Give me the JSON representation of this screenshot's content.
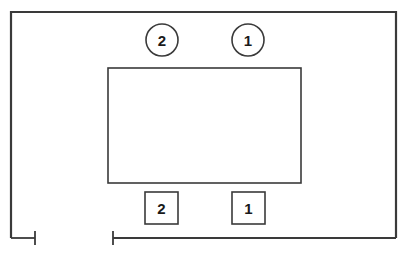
{
  "drawing": {
    "title": "Technical line drawing with numbered callouts",
    "canvas": {
      "width": 408,
      "height": 254
    },
    "style": {
      "background_color": "#ffffff",
      "line_color": "#3a3a3a",
      "text_color": "#1a1a1a",
      "outer_line_width": 2.2,
      "inner_line_width": 1.6,
      "callout_line_width": 1.6,
      "dimension_line_width": 1.8
    },
    "outer_outline": {
      "name": "outer-enclosure-outline",
      "left": 11,
      "top": 12,
      "right": 396,
      "bottom": 238,
      "open_bottom": true,
      "left_stub_end_x": 35
    },
    "inner_rectangle": {
      "name": "inner-panel-rectangle",
      "left": 108,
      "top": 68,
      "right": 301,
      "bottom": 183
    },
    "circle_callouts": [
      {
        "label": "2",
        "cx": 162,
        "cy": 40,
        "r": 16
      },
      {
        "label": "1",
        "cx": 248,
        "cy": 40,
        "r": 16
      }
    ],
    "box_callouts": [
      {
        "label": "2",
        "left": 145,
        "top": 192,
        "width": 33,
        "height": 32
      },
      {
        "label": "1",
        "left": 232,
        "top": 192,
        "width": 33,
        "height": 32
      }
    ],
    "dimension_lines": [
      {
        "name": "dimension-line-left",
        "y": 238,
        "x_start": 11,
        "x_end": 35,
        "tick_at": "end",
        "tick_half_height": 7
      },
      {
        "name": "dimension-line-main",
        "y": 238,
        "x_start": 113,
        "x_end": 396,
        "tick_at": "start",
        "tick_half_height": 7
      }
    ]
  }
}
